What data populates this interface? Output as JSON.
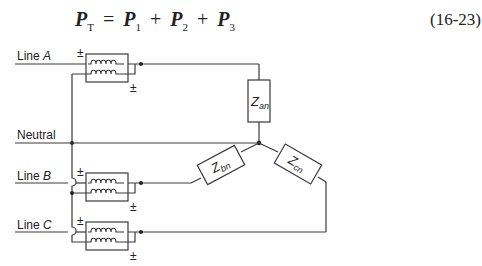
{
  "equation": {
    "lhs": "P",
    "lhs_sub": "T",
    "terms": [
      {
        "sym": "P",
        "sub": "1"
      },
      {
        "sym": "P",
        "sub": "2"
      },
      {
        "sym": "P",
        "sub": "3"
      }
    ],
    "equals": "=",
    "plus": "+",
    "number": "(16-23)"
  },
  "diagram": {
    "lines": [
      {
        "label_prefix": "Line ",
        "label_letter": "A"
      },
      {
        "label_prefix": "Line ",
        "label_letter": "B"
      },
      {
        "label_prefix": "Line ",
        "label_letter": "C"
      }
    ],
    "neutral_label": "Neutral",
    "polarity_mark": "±",
    "impedances": [
      {
        "sym": "Z",
        "sub": "an"
      },
      {
        "sym": "Z",
        "sub": "bn"
      },
      {
        "sym": "Z",
        "sub": "cn"
      }
    ],
    "stroke_color": "#3a3a3a"
  }
}
